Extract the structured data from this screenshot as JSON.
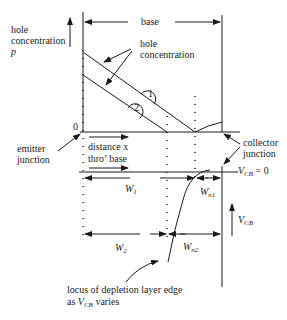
{
  "diagram": {
    "labels": {
      "base": "base",
      "hole_conc_axis_line1": "hole",
      "hole_conc_axis_line2": "concentration",
      "hole_conc_axis_symbol": "p",
      "hole_conc_curve_line1": "hole",
      "hole_conc_curve_line2": "concentration",
      "curve_1": "1",
      "curve_2": "2",
      "origin": "0",
      "emitter_junction_line1": "emitter",
      "emitter_junction_line2": "junction",
      "distance_line1": "distance x",
      "distance_line2": "thro’  base",
      "collector_junction_line1": "collector",
      "collector_junction_line2": "junction",
      "vcb_zero_main": "V",
      "vcb_zero_sub": "CB",
      "vcb_zero_rest": " = 0",
      "w1_main": "W",
      "w1_sub": "1",
      "wn1_main": "W",
      "wn1_sub": "n1",
      "w2_main": "W",
      "w2_sub": "2",
      "wn2_main": "W",
      "wn2_sub": "n2",
      "vcb_main": "V",
      "vcb_sub": "CB",
      "locus_line1": "locus of depletion layer edge",
      "locus_line2_prefix": "as ",
      "locus_line2_main": "V",
      "locus_line2_sub": "CB",
      "locus_line2_suffix": "  varies"
    },
    "colors": {
      "ink": "#1a1a1a",
      "background": "#ffffff"
    }
  }
}
